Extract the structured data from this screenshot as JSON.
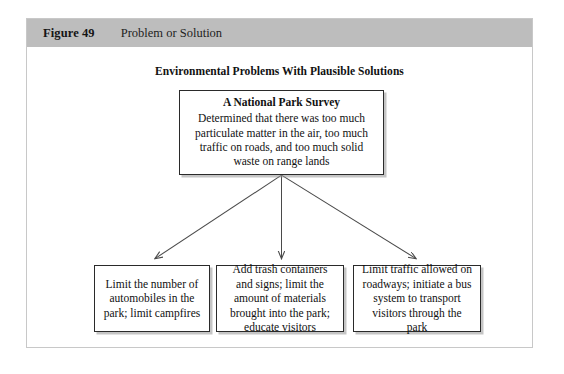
{
  "figure": {
    "label": "Figure 49",
    "caption": "Problem or Solution"
  },
  "diagram": {
    "title": "Environmental Problems With Plausible Solutions",
    "root": {
      "heading": "A National Park Survey",
      "body": "Determined that there was too much particulate matter in the air, too much traffic on roads, and too much solid waste on range lands"
    },
    "leaves": [
      {
        "text": "Limit the number of automobiles in the park; limit campfires"
      },
      {
        "text": "Add trash containers and signs; limit the amount of materials brought into the park; educate visitors"
      },
      {
        "text": "Limit traffic allowed on roadways; initiate a bus system to transport visitors through the park"
      }
    ],
    "colors": {
      "header_bar": "#bdbdbd",
      "box_border": "#2a2a2a",
      "connector": "#4a4a4a",
      "frame_border": "#c8c8c8",
      "text": "#111111"
    }
  }
}
